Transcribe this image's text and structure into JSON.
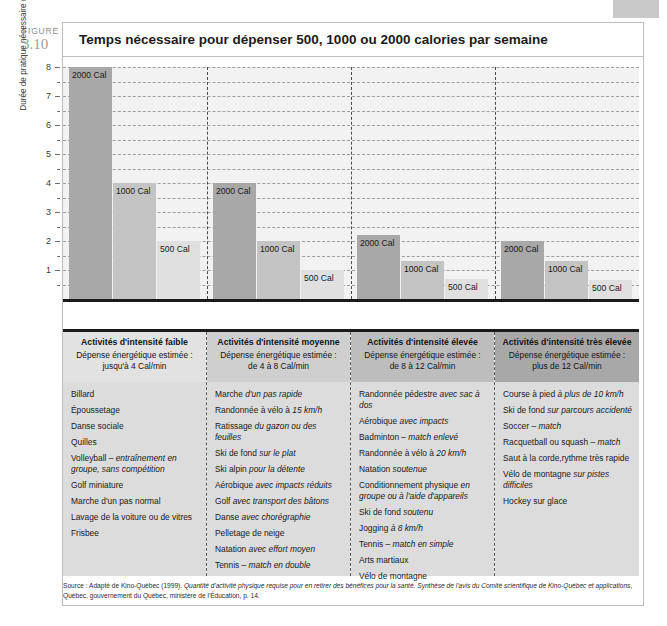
{
  "figure": {
    "word": "FIGURE",
    "number": "3.10",
    "title": "Temps nécessaire pour dépenser 500, 1000 ou 2000 calories par semaine"
  },
  "chart_data": {
    "type": "bar",
    "title": "Temps nécessaire pour dépenser 500, 1000 ou 2000 calories par semaine",
    "xlabel": "",
    "ylabel": "Durée de pratique nécessaire (en heures)",
    "ylim": [
      0,
      8
    ],
    "yticks": [
      1,
      2,
      3,
      4,
      5,
      6,
      7,
      8
    ],
    "minor_tick_step": 0.5,
    "grid": true,
    "legend_position": "in-bar labels",
    "categories": [
      "Activités d'intensité faible",
      "Activités d'intensité moyenne",
      "Activités d'intensité élevée",
      "Activités d'intensité très élevée"
    ],
    "series": [
      {
        "name": "2000 Cal",
        "values": [
          8,
          4,
          2.2,
          2.0
        ]
      },
      {
        "name": "1000 Cal",
        "values": [
          4,
          2,
          1.3,
          1.3
        ]
      },
      {
        "name": "500 Cal",
        "values": [
          2,
          1,
          0.7,
          0.65
        ]
      }
    ],
    "bar_labels": [
      "2000 Cal",
      "1000 Cal",
      "500 Cal"
    ],
    "colors": {
      "band_1": "#c6c6c6",
      "band_2": "#b4b4b4",
      "band_3": "#a0a0a0",
      "band_4": "#8d8d8d",
      "bar_2000": "#a8a8a8",
      "bar_1000": "#c4c4c4",
      "bar_500": "#e0e0e0",
      "plot_bg": "#f2f2f2",
      "axis": "#1a1a1a"
    }
  },
  "columns": [
    {
      "heading": "Activités d'intensité faible",
      "subheading_line1": "Dépense énergétique estimée :",
      "subheading_line2": "jusqu'à 4 Cal/min",
      "head_bg": "#e2e2e2",
      "activities": [
        {
          "text": "Billard",
          "italic": ""
        },
        {
          "text": "Époussetage",
          "italic": ""
        },
        {
          "text": "Danse sociale",
          "italic": ""
        },
        {
          "text": "Quilles",
          "italic": ""
        },
        {
          "text": "Volleyball – ",
          "italic": "entraînement en groupe, sans compétition"
        },
        {
          "text": "Golf miniature",
          "italic": ""
        },
        {
          "text": "Marche d'un pas normal",
          "italic": ""
        },
        {
          "text": "Lavage de la voiture ou de vitres",
          "italic": ""
        },
        {
          "text": "Frisbee",
          "italic": ""
        }
      ]
    },
    {
      "heading": "Activités d'intensité moyenne",
      "subheading_line1": "Dépense énergétique estimée :",
      "subheading_line2": "de 4 à 8 Cal/min",
      "head_bg": "#cfcfcf",
      "activities": [
        {
          "text": "Marche ",
          "italic": "d'un pas rapide"
        },
        {
          "text": "Randonnée à vélo à ",
          "italic": "15 km/h"
        },
        {
          "text": "Ratissage ",
          "italic": "du gazon ou des feuilles"
        },
        {
          "text": "Ski de fond ",
          "italic": "sur le plat"
        },
        {
          "text": "Ski alpin ",
          "italic": "pour la détente"
        },
        {
          "text": "Aérobique ",
          "italic": "avec impacts réduits"
        },
        {
          "text": "Golf ",
          "italic": "avec transport des bâtons"
        },
        {
          "text": "Danse ",
          "italic": "avec chorégraphie"
        },
        {
          "text": "Pelletage de neige",
          "italic": ""
        },
        {
          "text": "Natation ",
          "italic": "avec effort moyen"
        },
        {
          "text": "Tennis – ",
          "italic": "match en double"
        }
      ]
    },
    {
      "heading": "Activités d'intensité élevée",
      "subheading_line1": "Dépense énergétique estimée :",
      "subheading_line2": "de 8 à 12 Cal/min",
      "head_bg": "#bdbdbd",
      "activities": [
        {
          "text": "Randonnée pédestre ",
          "italic": "avec sac à dos"
        },
        {
          "text": "Aérobique ",
          "italic": "avec impacts"
        },
        {
          "text": "Badminton – ",
          "italic": "match enlevé"
        },
        {
          "text": "Randonnée à vélo à ",
          "italic": "20 km/h"
        },
        {
          "text": "Natation ",
          "italic": "soutenue"
        },
        {
          "text": "Conditionnement physique ",
          "italic": "en groupe ou à l'aide d'appareils"
        },
        {
          "text": "Ski de fond ",
          "italic": "soutenu"
        },
        {
          "text": "Jogging ",
          "italic": "à 8 km/h"
        },
        {
          "text": "Tennis – ",
          "italic": "match en simple"
        },
        {
          "text": "Arts martiaux",
          "italic": ""
        },
        {
          "text": "Vélo de montagne",
          "italic": ""
        }
      ]
    },
    {
      "heading": "Activités d'intensité très élevée",
      "subheading_line1": "Dépense énergétique estimée :",
      "subheading_line2": "plus de 12 Cal/min",
      "head_bg": "#a8a8a8",
      "activities": [
        {
          "text": "Course à pied ",
          "italic": "à plus de 10 km/h"
        },
        {
          "text": "Ski de fond ",
          "italic": "sur parcours accidenté"
        },
        {
          "text": "Soccer – ",
          "italic": "match"
        },
        {
          "text": "Racquetball ou squash – ",
          "italic": "match"
        },
        {
          "text": "Saut à la corde,rythme très rapide",
          "italic": ""
        },
        {
          "text": "Vélo de montagne ",
          "italic": "sur pistes difficiles"
        },
        {
          "text": "Hockey sur glace",
          "italic": ""
        }
      ]
    }
  ],
  "source": {
    "prefix": "Source : Adapté de Kino-Québec (1999). ",
    "italic1": "Quantité d'activité physique requise pour en retirer des bénéfices pour la santé. Synthèse de l'avis du Comité scientifique de Kino-Québec et applications",
    "suffix": ", Québec, gouvernement du Québec, ministère de l'Éducation, p. 14."
  }
}
